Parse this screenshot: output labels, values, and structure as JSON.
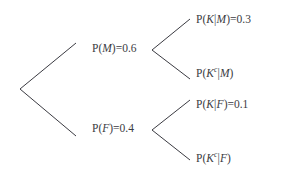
{
  "diagram": {
    "type": "probability-tree",
    "title": "",
    "background_color": "#ffffff",
    "line_color": "#3b3b42",
    "text_color": "#3b3b42",
    "root": {
      "label": "",
      "x": 20,
      "y": 89
    },
    "nodes": [
      {
        "id": "m",
        "level": 1,
        "prefix": "P(",
        "variable": "M",
        "suffix": ")",
        "equals": "=",
        "value": "0.6",
        "superscript": "",
        "text": "P(M)=0.6",
        "x": 92,
        "y": 49
      },
      {
        "id": "f",
        "level": 1,
        "prefix": "P(",
        "variable": "F",
        "suffix": ")",
        "equals": "=",
        "value": "0.4",
        "superscript": "",
        "text": "P(F)=0.4",
        "x": 92,
        "y": 129
      },
      {
        "id": "k-given-m",
        "level": 2,
        "prefix": "P(",
        "variable": "K",
        "superscript": "",
        "bar": "|",
        "condition": "M",
        "suffix": ")",
        "equals": "=",
        "value": "0.3",
        "text": "P(K|M)=0.3",
        "x": 196,
        "y": 20
      },
      {
        "id": "kc-given-m",
        "level": 2,
        "prefix": "P(",
        "variable": "K",
        "superscript": "c",
        "bar": "|",
        "condition": "M",
        "suffix": ")",
        "equals": "",
        "value": "",
        "text": "P(K^c|M)",
        "x": 196,
        "y": 74
      },
      {
        "id": "k-given-f",
        "level": 2,
        "prefix": "P(",
        "variable": "K",
        "superscript": "",
        "bar": "|",
        "condition": "F",
        "suffix": ")",
        "equals": "=",
        "value": "0.1",
        "text": "P(K|F)=0.1",
        "x": 196,
        "y": 105
      },
      {
        "id": "kc-given-f",
        "level": 2,
        "prefix": "P(",
        "variable": "K",
        "superscript": "c",
        "bar": "|",
        "condition": "F",
        "suffix": ")",
        "equals": "",
        "value": "",
        "text": "P(K^c|F)",
        "x": 196,
        "y": 159
      }
    ],
    "branches": [
      {
        "id": "root-to-m",
        "from": "root",
        "to": "m",
        "x1": 20,
        "y1": 89,
        "x2": 76,
        "y2": 43
      },
      {
        "id": "root-to-f",
        "from": "root",
        "to": "f",
        "x1": 20,
        "y1": 89,
        "x2": 76,
        "y2": 136
      },
      {
        "id": "m-to-km",
        "from": "m",
        "to": "k-given-m",
        "x1": 152,
        "y1": 50,
        "x2": 190,
        "y2": 19
      },
      {
        "id": "m-to-kcm",
        "from": "m",
        "to": "kc-given-m",
        "x1": 152,
        "y1": 50,
        "x2": 190,
        "y2": 79
      },
      {
        "id": "f-to-kf",
        "from": "f",
        "to": "k-given-f",
        "x1": 152,
        "y1": 130,
        "x2": 190,
        "y2": 100
      },
      {
        "id": "f-to-kcf",
        "from": "f",
        "to": "kc-given-f",
        "x1": 152,
        "y1": 130,
        "x2": 190,
        "y2": 160
      }
    ]
  }
}
